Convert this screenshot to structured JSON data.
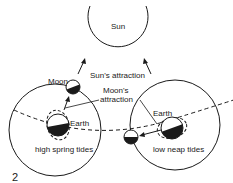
{
  "diagram": {
    "labels": {
      "sun": "Sun",
      "sun_attraction": "Sun's attraction",
      "moon": "Moon",
      "moons_attraction_line1": "Moon's",
      "moons_attraction_line2": "attraction",
      "earth_left": "Earth",
      "earth_right": "Earth",
      "spring_tides": "high spring tides",
      "neap_tides": "low neap tides",
      "figure_number": "2"
    },
    "colors": {
      "line": "#1a1a1a",
      "background": "#ffffff"
    }
  }
}
